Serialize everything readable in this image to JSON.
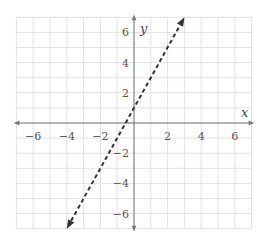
{
  "chart_data": {
    "type": "line",
    "title": "",
    "xlabel": "x",
    "ylabel": "y",
    "xlim": [
      -7,
      7
    ],
    "ylim": [
      -7,
      7
    ],
    "grid": true,
    "x_ticks": [
      -6,
      -4,
      -2,
      2,
      4,
      6
    ],
    "y_ticks": [
      6,
      4,
      2,
      -2,
      -4,
      -6
    ],
    "x_tick_labels": [
      "−6",
      "−4",
      "−2",
      "2",
      "4",
      "6"
    ],
    "y_tick_labels": [
      "6",
      "4",
      "2",
      "−2",
      "−4",
      "−6"
    ],
    "series": [
      {
        "name": "line",
        "style": "dashed",
        "arrows": "both",
        "equation": "y = 2x + 1",
        "slope": 2,
        "y_intercept": 1,
        "x": [
          -4,
          3
        ],
        "y": [
          -7,
          7
        ]
      }
    ]
  },
  "colors": {
    "grid": "#e2e2e2",
    "axis": "#777777",
    "line": "#333333"
  }
}
